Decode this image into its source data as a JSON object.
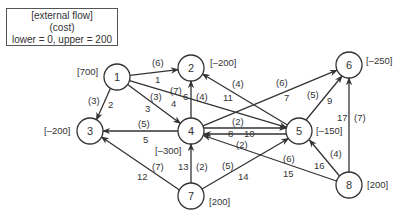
{
  "legend": {
    "line1": "[external flow]",
    "line2": "(cost)",
    "line3": "lower = 0, upper = 200"
  },
  "nodes": [
    {
      "id": "1",
      "supply": "[700]",
      "x": 117,
      "y": 77
    },
    {
      "id": "2",
      "supply": "[–200]",
      "x": 191,
      "y": 68
    },
    {
      "id": "3",
      "supply": "[–200]",
      "x": 90,
      "y": 131
    },
    {
      "id": "4",
      "supply": "[–300]",
      "x": 191,
      "y": 131
    },
    {
      "id": "5",
      "supply": "[–150]",
      "x": 299,
      "y": 131
    },
    {
      "id": "6",
      "supply": "[–250]",
      "x": 349,
      "y": 65
    },
    {
      "id": "7",
      "supply": "[200]",
      "x": 191,
      "y": 196
    },
    {
      "id": "8",
      "supply": "[200]",
      "x": 349,
      "y": 185
    }
  ],
  "edges": [
    {
      "num": "1",
      "from": "1",
      "to": "2",
      "cost": "(6)"
    },
    {
      "num": "2",
      "from": "1",
      "to": "3",
      "cost": "(3)"
    },
    {
      "num": "3",
      "from": "1",
      "to": "4",
      "cost": "(3)"
    },
    {
      "num": "4",
      "from": "1",
      "to": "5",
      "cost": "(7)"
    },
    {
      "num": "5",
      "from": "4",
      "to": "3",
      "cost": "(5)"
    },
    {
      "num": "6",
      "from": "4",
      "to": "2",
      "cost": "(4)"
    },
    {
      "num": "7",
      "from": "4",
      "to": "6",
      "cost": "(6)"
    },
    {
      "num": "8",
      "from": "4",
      "to": "5",
      "cost": "(2)"
    },
    {
      "num": "9",
      "from": "5",
      "to": "6",
      "cost": "(5)"
    },
    {
      "num": "10",
      "from": "5",
      "to": "4",
      "cost": "(2)"
    },
    {
      "num": "11",
      "from": "5",
      "to": "2",
      "cost": "(4)"
    },
    {
      "num": "12",
      "from": "7",
      "to": "3",
      "cost": "(7)"
    },
    {
      "num": "13",
      "from": "7",
      "to": "4",
      "cost": "(2)"
    },
    {
      "num": "14",
      "from": "7",
      "to": "5",
      "cost": "(5)"
    },
    {
      "num": "15",
      "from": "8",
      "to": "4",
      "cost": "(6)"
    },
    {
      "num": "16",
      "from": "8",
      "to": "5",
      "cost": "(4)"
    },
    {
      "num": "17",
      "from": "8",
      "to": "6",
      "cost": "(7)"
    }
  ]
}
